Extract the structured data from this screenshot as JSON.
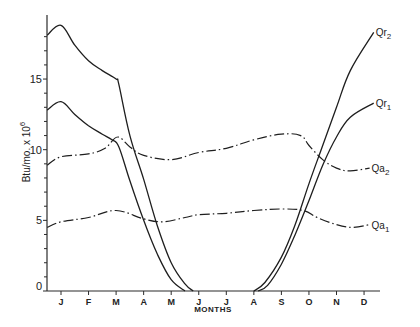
{
  "chart_data": {
    "type": "line",
    "title": "",
    "xlabel": "MONTHS",
    "ylabel": "Btu/mo. x 10^6",
    "ylabel_main": "Btu/mo. x 10",
    "ylabel_exp": "6",
    "categories": [
      "J",
      "F",
      "M",
      "A",
      "M",
      "J",
      "J",
      "A",
      "S",
      "O",
      "N",
      "D"
    ],
    "yticks": [
      0,
      5,
      10,
      15
    ],
    "ylim": [
      0,
      19
    ],
    "grid": false,
    "legend": "inline labels at right end of curves",
    "x_note": "x positions in month index units (0 = J tick, 11 = D tick); curves start slightly left of J tick",
    "series": [
      {
        "name": "Qr2",
        "label_main": "Qr",
        "label_sub": "2",
        "style": "solid",
        "points": [
          [
            -0.5,
            18.1
          ],
          [
            0,
            18.8
          ],
          [
            0.5,
            17.4
          ],
          [
            1,
            16.3
          ],
          [
            1.5,
            15.6
          ],
          [
            2,
            15.0
          ],
          [
            2.1,
            14.6
          ],
          [
            2.5,
            11.0
          ],
          [
            3,
            7.9
          ],
          [
            3.5,
            4.6
          ],
          [
            4,
            2.0
          ],
          [
            4.5,
            0.5
          ],
          [
            4.8,
            0.0
          ]
        ],
        "points2": [
          [
            7.0,
            0.0
          ],
          [
            7.4,
            0.6
          ],
          [
            8,
            2.4
          ],
          [
            8.5,
            4.7
          ],
          [
            9,
            7.6
          ],
          [
            9.5,
            10.3
          ],
          [
            10,
            13.0
          ],
          [
            10.5,
            15.6
          ],
          [
            11.35,
            18.3
          ]
        ]
      },
      {
        "name": "Qr1",
        "label_main": "Qr",
        "label_sub": "1",
        "style": "solid",
        "points": [
          [
            -0.5,
            12.8
          ],
          [
            0,
            13.4
          ],
          [
            0.5,
            12.5
          ],
          [
            1,
            11.7
          ],
          [
            1.5,
            11.1
          ],
          [
            1.85,
            10.7
          ],
          [
            2.1,
            10.2
          ],
          [
            2.5,
            7.8
          ],
          [
            3,
            5.0
          ],
          [
            3.5,
            2.6
          ],
          [
            4,
            0.8
          ],
          [
            4.5,
            0.0
          ]
        ],
        "points2": [
          [
            7.15,
            0.0
          ],
          [
            7.5,
            0.4
          ],
          [
            8,
            1.9
          ],
          [
            8.5,
            4.0
          ],
          [
            9,
            6.4
          ],
          [
            9.5,
            8.9
          ],
          [
            10,
            10.9
          ],
          [
            10.5,
            12.3
          ],
          [
            11.35,
            13.3
          ]
        ]
      },
      {
        "name": "Qa2",
        "label_main": "Qa",
        "label_sub": "2",
        "style": "dashdot",
        "points": [
          [
            -0.5,
            8.9
          ],
          [
            0,
            9.5
          ],
          [
            1,
            9.7
          ],
          [
            1.6,
            10.1
          ],
          [
            2.05,
            10.9
          ],
          [
            2.5,
            10.2
          ],
          [
            3,
            9.6
          ],
          [
            4,
            9.3
          ],
          [
            5,
            9.8
          ],
          [
            6,
            10.1
          ],
          [
            7,
            10.7
          ],
          [
            8,
            11.1
          ],
          [
            8.7,
            11.0
          ],
          [
            9,
            10.3
          ],
          [
            9.5,
            9.3
          ],
          [
            10,
            8.7
          ],
          [
            10.5,
            8.5
          ],
          [
            11.2,
            8.7
          ]
        ]
      },
      {
        "name": "Qa1",
        "label_main": "Qa",
        "label_sub": "1",
        "style": "dashdot",
        "points": [
          [
            -0.5,
            4.5
          ],
          [
            0,
            4.9
          ],
          [
            1,
            5.2
          ],
          [
            2,
            5.7
          ],
          [
            3,
            5.1
          ],
          [
            3.7,
            4.9
          ],
          [
            4.5,
            5.2
          ],
          [
            5,
            5.4
          ],
          [
            6,
            5.5
          ],
          [
            7,
            5.7
          ],
          [
            8,
            5.8
          ],
          [
            8.8,
            5.7
          ],
          [
            9.3,
            5.2
          ],
          [
            10,
            4.7
          ],
          [
            10.6,
            4.5
          ],
          [
            11.2,
            4.7
          ]
        ]
      }
    ]
  },
  "axes": {
    "x_title": "MONTHS",
    "y_title_main": "Btu/mo. x 10",
    "y_title_exp": "6"
  }
}
